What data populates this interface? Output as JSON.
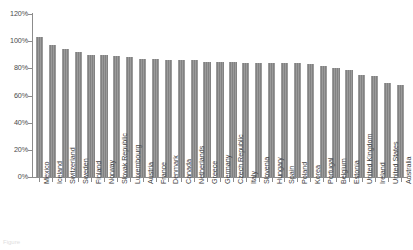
{
  "chart_data": {
    "type": "bar",
    "title": "",
    "xlabel": "",
    "ylabel": "",
    "ylim": [
      0,
      120
    ],
    "ytick_labels": [
      "120%",
      "100%",
      "80%",
      "60%",
      "40%",
      "20%",
      "0%"
    ],
    "ytick_values": [
      120,
      100,
      80,
      60,
      40,
      20,
      0
    ],
    "grid": false,
    "legend": false,
    "bar_color": "#828282",
    "categories": [
      "Mexico",
      "Iceland",
      "Switzerland",
      "Sweden",
      "Finland",
      "Norway",
      "Slovak Republic",
      "Luxembourg",
      "Austria",
      "France",
      "Denmark",
      "Canada",
      "Netherlands",
      "Greece",
      "Germany",
      "Czech Republic",
      "Italy",
      "Slovenia",
      "Hungary",
      "Spain",
      "Poland",
      "Korea",
      "Portugal",
      "Belgium",
      "Estonia",
      "United Kingdom",
      "Ireland",
      "United States",
      "Australia"
    ],
    "values": [
      103,
      97,
      94,
      92,
      90,
      90,
      89,
      88,
      87,
      87,
      86,
      86,
      86,
      85,
      85,
      85,
      84,
      84,
      84,
      84,
      84,
      83,
      82,
      80,
      79,
      75,
      74,
      69,
      68
    ]
  },
  "caption": {
    "text": "Figure"
  }
}
